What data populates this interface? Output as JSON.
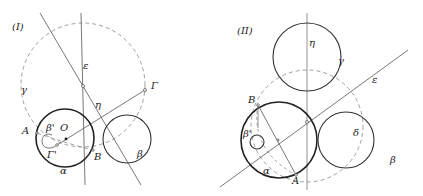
{
  "figures": [
    {
      "id": "I",
      "title": "(I)",
      "labels": {
        "epsilon": "ε",
        "eta": "η",
        "gamma_circle": "γ",
        "Gamma": "Γ",
        "A": "A",
        "beta_prime": "β'",
        "O": "O",
        "Gamma_prime": "Γ'",
        "B": "B",
        "alpha": "α",
        "beta": "β"
      }
    },
    {
      "id": "II",
      "title": "(II)",
      "labels": {
        "eta": "η",
        "gamma": "γ",
        "epsilon": "ε",
        "B": "B",
        "beta_prime": "β'",
        "delta": "δ",
        "alpha": "α",
        "A": "A",
        "beta": "β"
      }
    }
  ],
  "colors": {
    "stroke": "#222222",
    "thin": "#555555",
    "dashed": "#888888",
    "background": "#ffffff"
  }
}
